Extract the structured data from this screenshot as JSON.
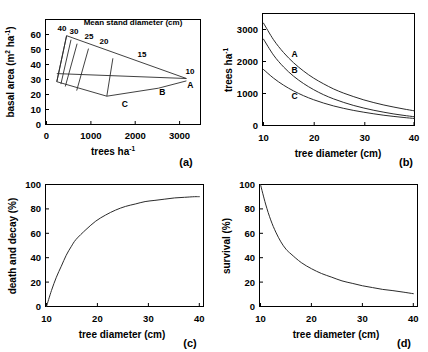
{
  "figure": {
    "panel_count": 4
  },
  "chart_data": [
    {
      "id": "a",
      "type": "line",
      "panel_letter": "(a)",
      "title": "Mean stand diameter (cm)",
      "xlabel": "trees ha",
      "xlabel_sup": "-1",
      "ylabel": "basal area (m",
      "ylabel_sup": "2",
      "ylabel_sup2": "-1",
      "ylabel_mid": " ha",
      "ylabel_end": ")",
      "xlim": [
        0,
        3500
      ],
      "ylim": [
        0,
        65
      ],
      "xticks": [
        0,
        1000,
        2000,
        3000
      ],
      "yticks": [
        0,
        10,
        20,
        30,
        40,
        50,
        60
      ],
      "xtick_labels": [
        "0",
        "1000",
        "2000",
        "3000"
      ],
      "ytick_labels": [
        "0",
        "10",
        "20",
        "30",
        "40",
        "50",
        "60"
      ],
      "grid": false,
      "isoline_labels": [
        "40",
        "30",
        "25",
        "20",
        "15",
        "10"
      ],
      "isolines": [
        {
          "label": "40",
          "top": [
            460,
            55
          ],
          "bottom": [
            235,
            26.5
          ]
        },
        {
          "label": "30",
          "top": [
            560,
            52.5
          ],
          "bottom": [
            330,
            25.0
          ]
        },
        {
          "label": "25",
          "top": [
            700,
            50.0
          ],
          "bottom": [
            430,
            23.5
          ]
        },
        {
          "label": "20",
          "top": [
            960,
            47.0
          ],
          "bottom": [
            690,
            21.0
          ]
        },
        {
          "label": "15",
          "top": [
            1520,
            41.0
          ],
          "bottom": [
            1380,
            17.5
          ]
        },
        {
          "label": "10",
          "top": [
            3200,
            28.5
          ],
          "bottom": [
            3200,
            28.5
          ]
        }
      ],
      "upper_envelope": [
        [
          235,
          26.5
        ],
        [
          460,
          55
        ],
        [
          3200,
          28.5
        ]
      ],
      "lower_envelope": [
        [
          235,
          26.5
        ],
        [
          1380,
          17.5
        ],
        [
          2560,
          22.5
        ],
        [
          3200,
          27.0
        ]
      ],
      "mid_line": [
        [
          235,
          31.5
        ],
        [
          3200,
          28.5
        ]
      ],
      "points": [
        {
          "label": "A",
          "x": 3200,
          "y": 27.0
        },
        {
          "label": "B",
          "x": 2560,
          "y": 22.5
        },
        {
          "label": "C",
          "x": 1700,
          "y": 15.0
        }
      ]
    },
    {
      "id": "b",
      "type": "line",
      "panel_letter": "(b)",
      "xlabel": "tree diameter (cm)",
      "ylabel": "trees ha",
      "ylabel_sup": "-1",
      "xlim": [
        10,
        40
      ],
      "ylim": [
        0,
        3500
      ],
      "xticks": [
        10,
        20,
        30,
        40
      ],
      "yticks": [
        0,
        1000,
        2000,
        3000
      ],
      "xtick_labels": [
        "10",
        "20",
        "30",
        "40"
      ],
      "ytick_labels": [
        "0",
        "1000",
        "2000",
        "3000"
      ],
      "grid": false,
      "legend_position": "inline",
      "series": [
        {
          "name": "A",
          "label_at": {
            "x": 16.2,
            "y": 2130
          },
          "x": [
            10,
            12,
            14,
            16,
            18,
            20,
            22,
            24,
            26,
            28,
            30,
            32,
            34,
            36,
            38,
            40
          ],
          "values": [
            3200,
            2680,
            2280,
            1960,
            1700,
            1480,
            1300,
            1140,
            1010,
            900,
            800,
            715,
            640,
            575,
            515,
            460
          ]
        },
        {
          "name": "B",
          "label_at": {
            "x": 16.2,
            "y": 1640
          },
          "x": [
            10,
            12,
            14,
            16,
            18,
            20,
            22,
            24,
            26,
            28,
            30,
            32,
            34,
            36,
            38,
            40
          ],
          "values": [
            2700,
            2200,
            1830,
            1540,
            1310,
            1120,
            960,
            830,
            720,
            625,
            545,
            475,
            415,
            360,
            315,
            275
          ]
        },
        {
          "name": "C",
          "label_at": {
            "x": 16.2,
            "y": 820
          },
          "x": [
            10,
            12,
            14,
            16,
            18,
            20,
            22,
            24,
            26,
            28,
            30,
            32,
            34,
            36,
            38,
            40
          ],
          "values": [
            1750,
            1480,
            1260,
            1080,
            930,
            805,
            700,
            610,
            535,
            470,
            415,
            365,
            320,
            283,
            250,
            220
          ]
        }
      ]
    },
    {
      "id": "c",
      "type": "line",
      "panel_letter": "(c)",
      "xlabel": "tree diameter (cm)",
      "ylabel": "death and decay (%)",
      "xlim": [
        10,
        41
      ],
      "ylim": [
        0,
        100
      ],
      "xticks": [
        10,
        20,
        30,
        40
      ],
      "yticks": [
        0,
        20,
        40,
        60,
        80,
        100
      ],
      "xtick_labels": [
        "10",
        "20",
        "30",
        "40"
      ],
      "ytick_labels": [
        "0",
        "20",
        "40",
        "60",
        "80",
        "100"
      ],
      "grid": false,
      "x": [
        10,
        11,
        12,
        13,
        14,
        15,
        16,
        18,
        20,
        22,
        24,
        26,
        28,
        30,
        32,
        34,
        36,
        38,
        40,
        41
      ],
      "values": [
        0,
        13,
        24,
        33,
        42,
        49,
        55,
        63,
        70,
        75,
        79,
        82,
        84,
        86,
        87,
        88,
        89,
        89.5,
        90,
        90
      ]
    },
    {
      "id": "d",
      "type": "line",
      "panel_letter": "(d)",
      "xlabel": "tree diameter (cm)",
      "ylabel": "survival (%)",
      "xlim": [
        10,
        40
      ],
      "ylim": [
        0,
        100
      ],
      "xticks": [
        10,
        20,
        30,
        40
      ],
      "yticks": [
        0,
        20,
        40,
        60,
        80,
        100
      ],
      "xtick_labels": [
        "10",
        "20",
        "30",
        "40"
      ],
      "ytick_labels": [
        "0",
        "20",
        "40",
        "60",
        "80",
        "100"
      ],
      "grid": false,
      "x": [
        10,
        11,
        12,
        13,
        14,
        15,
        16,
        18,
        20,
        22,
        24,
        26,
        28,
        30,
        32,
        34,
        36,
        38,
        40
      ],
      "values": [
        100,
        84,
        71,
        61,
        53,
        47,
        43,
        36,
        31,
        27,
        24,
        21,
        19,
        17,
        15.5,
        14,
        13,
        11.8,
        10.5
      ]
    }
  ]
}
